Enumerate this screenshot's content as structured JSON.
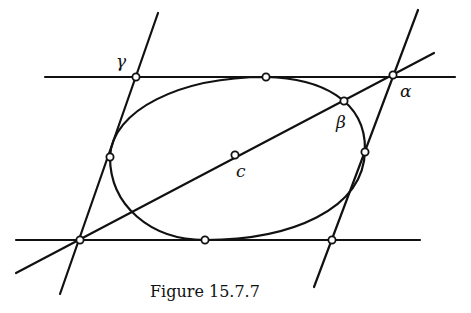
{
  "figure": {
    "caption": "Figure 15.7.7",
    "labels": {
      "gamma": "γ",
      "alpha": "α",
      "beta": "β",
      "center": "c"
    }
  },
  "geometry": {
    "ellipse": {
      "cx": 236,
      "cy": 157,
      "rx": 132,
      "ry": 80,
      "rotation": -18
    },
    "lines": {
      "top": [
        45,
        77,
        455,
        77
      ],
      "bottom": [
        16,
        240,
        420,
        240
      ],
      "left": [
        158,
        13,
        60,
        294
      ],
      "right": [
        418,
        10,
        314,
        287
      ],
      "diagonal": [
        16,
        273,
        434,
        53
      ]
    },
    "points": {
      "gamma": [
        136,
        77
      ],
      "alpha": [
        393,
        75
      ],
      "beta": [
        344,
        101
      ],
      "center": [
        235,
        155
      ],
      "top_tangent": [
        266,
        77
      ],
      "bottom_tangent": [
        205,
        240
      ],
      "left_tangent": [
        110,
        157
      ],
      "right_tangent": [
        365,
        152
      ],
      "bottom_left_corner": [
        80,
        240
      ],
      "bottom_right_corner": [
        332,
        240
      ]
    }
  }
}
